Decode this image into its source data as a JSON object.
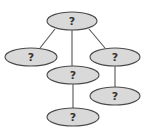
{
  "diagram": {
    "type": "tree",
    "colors": {
      "node_fill": "#d9d9d9",
      "node_stroke": "#4a4a4a",
      "edge": "#555555",
      "label": "#333333",
      "background": "#ffffff"
    },
    "nodes": [
      {
        "id": "root",
        "label": "?",
        "cx": 72,
        "cy": 21,
        "rx": 25,
        "ry": 9
      },
      {
        "id": "left",
        "label": "?",
        "cx": 31,
        "cy": 57,
        "rx": 26,
        "ry": 9
      },
      {
        "id": "middle",
        "label": "?",
        "cx": 73,
        "cy": 75,
        "rx": 26,
        "ry": 9
      },
      {
        "id": "right",
        "label": "?",
        "cx": 115,
        "cy": 57,
        "rx": 25,
        "ry": 9
      },
      {
        "id": "right-child",
        "label": "?",
        "cx": 115,
        "cy": 96,
        "rx": 25,
        "ry": 9
      },
      {
        "id": "bottom",
        "label": "?",
        "cx": 73,
        "cy": 117,
        "rx": 26,
        "ry": 9
      }
    ],
    "edges": [
      {
        "from": "root",
        "to": "left"
      },
      {
        "from": "root",
        "to": "middle"
      },
      {
        "from": "root",
        "to": "right"
      },
      {
        "from": "right",
        "to": "right-child"
      },
      {
        "from": "middle",
        "to": "bottom"
      }
    ]
  }
}
